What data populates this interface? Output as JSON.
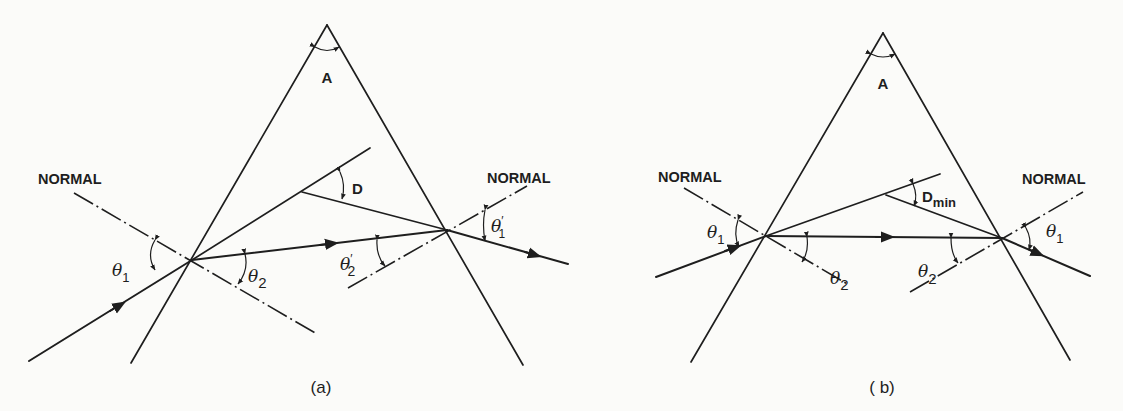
{
  "figure": {
    "panels": [
      {
        "id": "a",
        "caption": "(a)",
        "apex_label": "A",
        "deviation_label": "D",
        "normal_left_label": "NORMAL",
        "normal_right_label": "NORMAL",
        "theta_in": "θ",
        "theta_in_sub": "1",
        "theta_refr": "θ",
        "theta_refr_sub": "2",
        "theta_int": "θ",
        "theta_int_sub": "2",
        "theta_int_prime": "′",
        "theta_out": "θ",
        "theta_out_sub": "1",
        "theta_out_prime": "′"
      },
      {
        "id": "b",
        "caption": "( b)",
        "apex_label": "A",
        "deviation_label": "D",
        "deviation_sub": "min",
        "normal_left_label": "NORMAL",
        "normal_right_label": "NORMAL",
        "theta_in": "θ",
        "theta_in_sub": "1",
        "theta_refr": "θ",
        "theta_refr_sub": "2",
        "theta_int": "θ",
        "theta_int_sub": "2",
        "theta_out": "θ",
        "theta_out_sub": "1"
      }
    ],
    "colors": {
      "ink": "#1e1e1e",
      "paper": "#fbfbf9"
    }
  }
}
